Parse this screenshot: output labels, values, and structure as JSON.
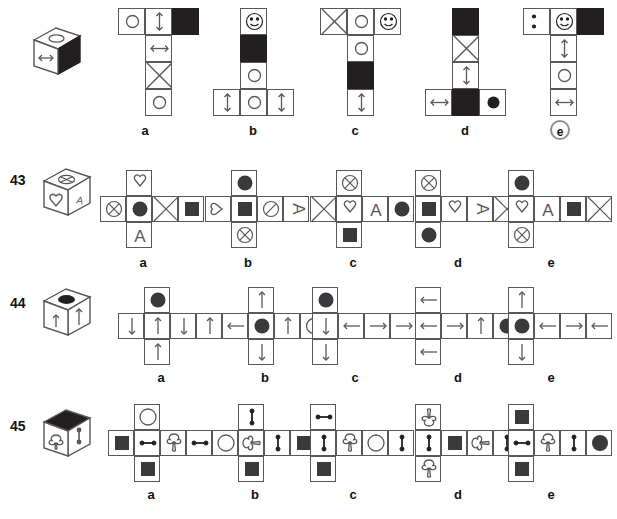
{
  "page": {
    "width": 617,
    "height": 519,
    "background": "#ffffff",
    "line_color": "#58585a",
    "fill_color": "#231f20"
  },
  "option_labels": [
    "a",
    "b",
    "c",
    "d",
    "e"
  ],
  "rows": [
    {
      "number": "",
      "number_visible": false,
      "correct_answer": "e",
      "cube": {
        "name": "cube-42",
        "front_face": "left-right-arrow",
        "top_face": "open-ellipse",
        "right_face": "black-filled"
      },
      "options": [
        {
          "label": "a",
          "faces": [
            "open-circle",
            "up-down-arrow",
            "black-filled",
            "left-right-arrow",
            "crossed-box",
            "open-circle"
          ]
        },
        {
          "label": "b",
          "faces": [
            "smiley",
            "black-filled",
            "open-circle",
            "up-down-arrow",
            "open-circle",
            "up-down-arrow"
          ]
        },
        {
          "label": "c",
          "faces": [
            "crossed-box",
            "open-circle",
            "smiley",
            "open-circle",
            "black-filled",
            "up-down-arrow"
          ]
        },
        {
          "label": "d",
          "faces": [
            "black-filled",
            "crossed-box",
            "up-down-arrow",
            "left-right-arrow",
            "black-filled",
            "filled-circle"
          ]
        },
        {
          "label": "e",
          "faces": [
            "two-dots",
            "smiley",
            "black-filled",
            "up-down-arrow",
            "open-circle",
            "left-right-arrow"
          ]
        }
      ]
    },
    {
      "number": "43",
      "number_visible": true,
      "correct_answer": "",
      "cube": {
        "name": "cube-43",
        "front_face": "heart",
        "top_face": "crossed-circle",
        "right_face": "letter-a"
      },
      "options": [
        {
          "label": "a",
          "faces": [
            "crossed-circle",
            "filled-circle",
            "crossed-box",
            "black-square",
            "heart",
            "letter-a"
          ]
        },
        {
          "label": "b",
          "faces": [
            "heart-left",
            "black-square",
            "slashed-circle",
            "letter-a-rot",
            "filled-circle",
            "crossed-circle"
          ]
        },
        {
          "label": "c",
          "faces": [
            "crossed-box",
            "heart",
            "letter-a",
            "filled-circle",
            "crossed-circle",
            "black-square"
          ]
        },
        {
          "label": "d",
          "faces": [
            "crossed-circle",
            "black-square",
            "filled-circle",
            "heart",
            "letter-a-rot",
            "crossed-box"
          ]
        },
        {
          "label": "e",
          "faces": [
            "filled-circle",
            "heart",
            "crossed-circle",
            "letter-a",
            "black-square",
            "crossed-box"
          ]
        }
      ]
    },
    {
      "number": "44",
      "number_visible": true,
      "correct_answer": "",
      "cube": {
        "name": "cube-44",
        "front_face": "up-arrow",
        "top_face": "black-ellipse",
        "right_face": "up-arrow"
      },
      "options": [
        {
          "label": "a",
          "faces": [
            "filled-circle",
            "down-arrow",
            "up-arrow",
            "down-arrow",
            "up-arrow",
            "up-arrow"
          ]
        },
        {
          "label": "b",
          "faces": [
            "up-arrow",
            "left-arrow",
            "filled-circle",
            "up-arrow",
            "open-circle",
            "down-arrow"
          ]
        },
        {
          "label": "c",
          "faces": [
            "filled-circle",
            "down-arrow",
            "left-arrow",
            "right-arrow",
            "right-arrow",
            "down-arrow"
          ]
        },
        {
          "label": "d",
          "faces": [
            "left-arrow",
            "left-arrow",
            "right-arrow",
            "up-arrow",
            "filled-circle",
            "left-arrow"
          ]
        },
        {
          "label": "e",
          "faces": [
            "up-arrow",
            "filled-circle",
            "left-arrow",
            "right-arrow",
            "left-arrow",
            "down-arrow"
          ]
        }
      ]
    },
    {
      "number": "45",
      "number_visible": true,
      "correct_answer": "",
      "cube": {
        "name": "cube-45",
        "front_face": "club",
        "top_face": "black-filled",
        "right_face": "vertical-dumbbell"
      },
      "options": [
        {
          "label": "a",
          "faces": [
            "open-circle",
            "black-square",
            "horizontal-dumbbell",
            "club",
            "horizontal-dumbbell",
            "black-square"
          ]
        },
        {
          "label": "b",
          "faces": [
            "vertical-dumbbell",
            "open-circle",
            "club-rot",
            "vertical-dumbbell",
            "black-square",
            "black-square"
          ]
        },
        {
          "label": "c",
          "faces": [
            "horizontal-dumbbell",
            "vertical-dumbbell",
            "club",
            "open-circle",
            "vertical-dumbbell",
            "black-square"
          ]
        },
        {
          "label": "d",
          "faces": [
            "club-down",
            "vertical-dumbbell",
            "club",
            "black-square",
            "club-rot",
            "vertical-dumbbell"
          ]
        },
        {
          "label": "e",
          "faces": [
            "black-square",
            "horizontal-dumbbell",
            "club",
            "vertical-dumbbell",
            "filled-circle",
            "black-square"
          ]
        }
      ]
    }
  ]
}
